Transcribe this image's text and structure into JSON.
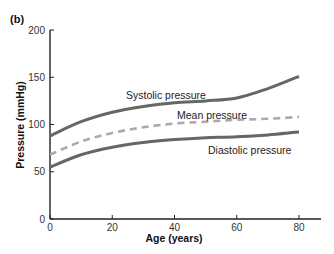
{
  "panel_label": "(b)",
  "colors": {
    "solid_series": "#666666",
    "dashed_series": "#aaaaaa",
    "axis": "#222222"
  },
  "chart_data": {
    "type": "line",
    "title": "",
    "xlabel": "Age (years)",
    "ylabel": "Pressure (mmHg)",
    "xlim": [
      0,
      85
    ],
    "ylim": [
      0,
      200
    ],
    "xticks": [
      0,
      20,
      40,
      60,
      80
    ],
    "yticks": [
      0,
      50,
      100,
      150,
      200
    ],
    "grid": false,
    "legend": "inline labels",
    "x": [
      0,
      10,
      20,
      30,
      40,
      50,
      60,
      70,
      80
    ],
    "series": [
      {
        "name": "Systolic pressure",
        "style": "solid",
        "values": [
          88,
          103,
          113,
          119,
          123,
          125,
          128,
          138,
          151
        ]
      },
      {
        "name": "Mean pressure",
        "style": "dashed",
        "values": [
          68,
          82,
          91,
          97,
          101,
          103,
          105,
          106,
          108
        ]
      },
      {
        "name": "Diastolic pressure",
        "style": "solid",
        "values": [
          55,
          68,
          76,
          81,
          84,
          86,
          87,
          89,
          92
        ]
      }
    ]
  }
}
